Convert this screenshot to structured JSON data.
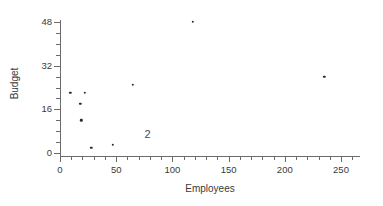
{
  "chart_data": {
    "type": "scatter",
    "title": "",
    "xlabel": "Employees",
    "ylabel": "Budget",
    "xlim": [
      0,
      267
    ],
    "ylim": [
      -1,
      50
    ],
    "grid": false,
    "legend": "none",
    "x_ticks": [
      {
        "value": 0,
        "label": "0"
      },
      {
        "value": 50,
        "label": "50"
      },
      {
        "value": 100,
        "label": "100"
      },
      {
        "value": 150,
        "label": "150"
      },
      {
        "value": 200,
        "label": "200"
      },
      {
        "value": 250,
        "label": "250"
      }
    ],
    "x_minor_ticks": [
      10,
      20,
      30,
      40,
      60,
      70,
      80,
      90,
      110,
      120,
      130,
      140,
      160,
      170,
      180,
      190,
      210,
      220,
      230,
      240,
      260
    ],
    "y_ticks": [
      {
        "value": 0,
        "label": "0"
      },
      {
        "value": 16,
        "label": "16"
      },
      {
        "value": 32,
        "label": "32"
      },
      {
        "value": 48,
        "label": "48"
      }
    ],
    "y_minor_ticks": [
      4,
      8,
      12,
      20,
      24,
      28,
      36,
      40,
      44
    ],
    "points": [
      {
        "x": 9,
        "y": 22
      },
      {
        "x": 22,
        "y": 22
      },
      {
        "x": 18,
        "y": 18
      },
      {
        "x": 19,
        "y": 12
      },
      {
        "x": 28,
        "y": 2
      },
      {
        "x": 47,
        "y": 3
      },
      {
        "x": 65,
        "y": 25
      },
      {
        "x": 118,
        "y": 48
      },
      {
        "x": 235,
        "y": 28
      }
    ],
    "annotations": [
      {
        "text": "2",
        "x": 78,
        "y": 7
      }
    ],
    "colors": {
      "background": "#ffffff",
      "axis": "#6b6b6b",
      "text": "#3a3a3a",
      "marker": "#2b2b2b"
    }
  }
}
